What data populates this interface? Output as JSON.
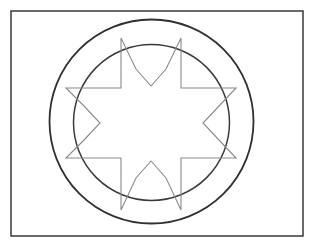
{
  "page": {
    "width": 315,
    "height": 247,
    "background_color": "#ffffff"
  },
  "figure": {
    "caption": "",
    "frame": {
      "label": "Outer rectangular frame",
      "x": 11,
      "y": 11,
      "width": 292,
      "height": 225,
      "stroke_color": "#2b2b2b",
      "stroke_width": 1.4,
      "fill": "none"
    },
    "outer_circle": {
      "label": "Outer circle",
      "cx": 151.5,
      "cy": 121.5,
      "r": 102,
      "stroke_color": "#303030",
      "stroke_width": 1.8,
      "fill": "none"
    },
    "inner_circle": {
      "label": "Inner circle",
      "cx": 151.5,
      "cy": 122.5,
      "r": 78,
      "stroke_color": "#3a3a3a",
      "stroke_width": 1.5,
      "fill": "none"
    },
    "star": {
      "label": "Eight-pointed star",
      "points_count": 8,
      "cx": 151.5,
      "cy": 123,
      "outer_radius": 86,
      "inner_radius": 50,
      "stroke_color": "#8a8a8a",
      "stroke_width": 1.1,
      "fill": "none",
      "polygon_points": "121,38 136,69 151,86 166,69 181,38 181,88 211,88 236,88 219,106 203,123 219,140 236,158 181,158 181,210 166,178 151,161 136,178 121,210 121,158 66,158 84,140 100,123 84,106 66,88 121,88",
      "vertices": [
        {
          "name": "top-left-point-outer-left",
          "x": 121,
          "y": 38
        },
        {
          "name": "top-notch-left",
          "x": 136,
          "y": 69
        },
        {
          "name": "top-notch-vertex",
          "x": 151,
          "y": 86
        },
        {
          "name": "top-notch-right",
          "x": 166,
          "y": 69
        },
        {
          "name": "top-right-point-outer-right",
          "x": 181,
          "y": 38
        },
        {
          "name": "upper-right-square-corner",
          "x": 181,
          "y": 88
        },
        {
          "name": "right-upper-edge",
          "x": 211,
          "y": 88
        },
        {
          "name": "right-point-top",
          "x": 236,
          "y": 88
        },
        {
          "name": "right-notch-upper",
          "x": 219,
          "y": 106
        },
        {
          "name": "right-notch-vertex",
          "x": 203,
          "y": 123
        },
        {
          "name": "right-notch-lower",
          "x": 219,
          "y": 140
        },
        {
          "name": "right-point-bottom",
          "x": 236,
          "y": 158
        },
        {
          "name": "lower-right-square-corner",
          "x": 181,
          "y": 158
        },
        {
          "name": "bottom-right-point-outer",
          "x": 181,
          "y": 210
        },
        {
          "name": "bottom-notch-right",
          "x": 166,
          "y": 178
        },
        {
          "name": "bottom-notch-vertex",
          "x": 151,
          "y": 161
        },
        {
          "name": "bottom-notch-left",
          "x": 136,
          "y": 178
        },
        {
          "name": "bottom-left-point-outer",
          "x": 121,
          "y": 210
        },
        {
          "name": "lower-left-square-corner",
          "x": 121,
          "y": 158
        },
        {
          "name": "left-point-bottom",
          "x": 66,
          "y": 158
        },
        {
          "name": "left-notch-lower",
          "x": 84,
          "y": 140
        },
        {
          "name": "left-notch-vertex",
          "x": 100,
          "y": 123
        },
        {
          "name": "left-notch-upper",
          "x": 84,
          "y": 106
        },
        {
          "name": "left-point-top",
          "x": 66,
          "y": 88
        },
        {
          "name": "upper-left-square-corner",
          "x": 121,
          "y": 88
        }
      ]
    }
  }
}
